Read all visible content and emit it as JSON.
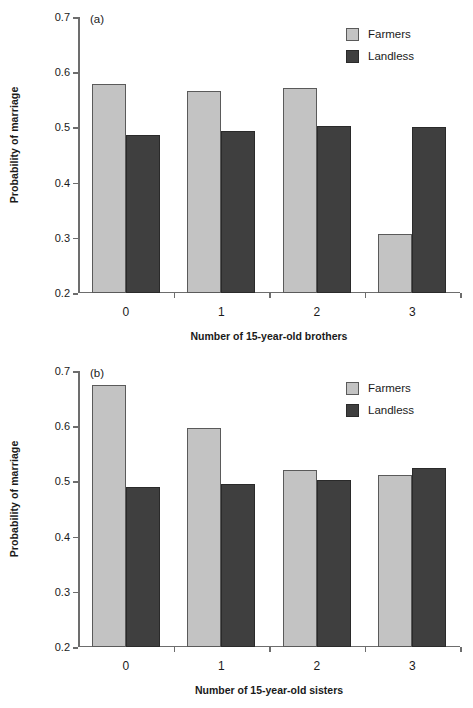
{
  "figure": {
    "background": "#ffffff",
    "series_colors": {
      "farmers": "#c3c3c3",
      "landless": "#3f3f3f"
    }
  },
  "chart_data": [
    {
      "type": "bar",
      "panel": "(a)",
      "title": "",
      "xlabel": "Number of 15-year-old brothers",
      "ylabel": "Probability of marriage",
      "categories": [
        "0",
        "1",
        "2",
        "3"
      ],
      "series": [
        {
          "name": "Farmers",
          "values": [
            0.578,
            0.566,
            0.572,
            0.307
          ]
        },
        {
          "name": "Landless",
          "values": [
            0.487,
            0.493,
            0.502,
            0.5
          ]
        }
      ],
      "ylim": [
        0.2,
        0.7
      ],
      "yticks": [
        "0.2",
        "0.3",
        "0.4",
        "0.5",
        "0.6",
        "0.7"
      ],
      "ytick_values": [
        0.2,
        0.3,
        0.4,
        0.5,
        0.6,
        0.7
      ],
      "grid": false,
      "legend_position": "top-right",
      "legend": [
        "Farmers",
        "Landless"
      ]
    },
    {
      "type": "bar",
      "panel": "(b)",
      "title": "",
      "xlabel": "Number of 15-year-old sisters",
      "ylabel": "Probability of marriage",
      "categories": [
        "0",
        "1",
        "2",
        "3"
      ],
      "series": [
        {
          "name": "Farmers",
          "values": [
            0.674,
            0.596,
            0.52,
            0.512
          ]
        },
        {
          "name": "Landless",
          "values": [
            0.49,
            0.496,
            0.503,
            0.525
          ]
        }
      ],
      "ylim": [
        0.2,
        0.7
      ],
      "yticks": [
        "0.2",
        "0.3",
        "0.4",
        "0.5",
        "0.6",
        "0.7"
      ],
      "ytick_values": [
        0.2,
        0.3,
        0.4,
        0.5,
        0.6,
        0.7
      ],
      "grid": false,
      "legend_position": "top-right",
      "legend": [
        "Farmers",
        "Landless"
      ]
    }
  ]
}
